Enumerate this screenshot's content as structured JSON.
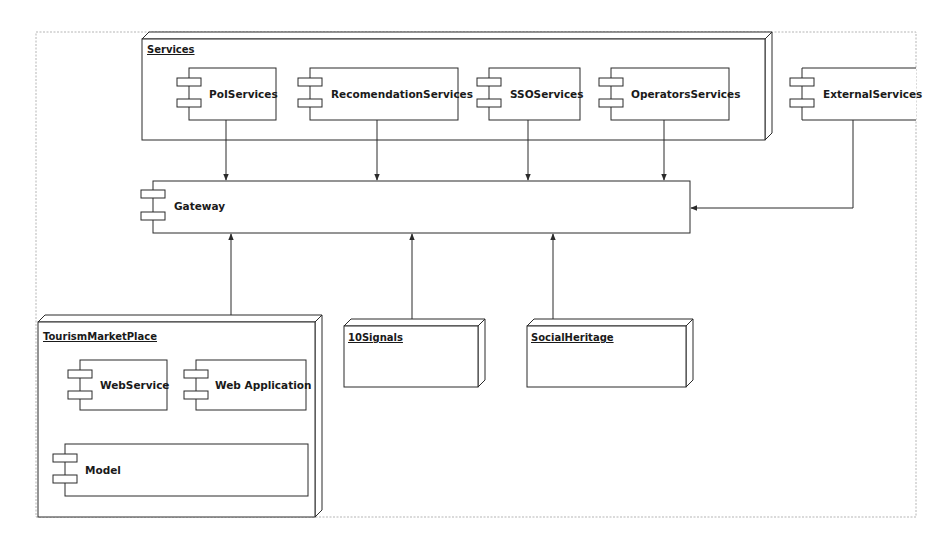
{
  "diagram": {
    "type": "UML deployment/component diagram",
    "colors": {
      "stroke": "#2b2b2b",
      "frame": "#b0b0b0",
      "background": "#ffffff"
    },
    "nodes": {
      "services": {
        "title": "Services"
      },
      "tourism_market_place": {
        "title": "TourismMarketPlace"
      },
      "ten_signals": {
        "title": "10Signals"
      },
      "social_heritage": {
        "title": "SocialHeritage"
      }
    },
    "components": {
      "poi_services": {
        "label": "PoIServices"
      },
      "recomendation_services": {
        "label": "RecomendationServices"
      },
      "sso_services": {
        "label": "SSOServices"
      },
      "operators_services": {
        "label": "OperatorsServices"
      },
      "external_services": {
        "label": "ExternalServices"
      },
      "gateway": {
        "label": "Gateway"
      },
      "web_service": {
        "label": "WebService"
      },
      "web_application": {
        "label": "Web Application"
      },
      "model": {
        "label": "Model"
      }
    },
    "connections": [
      {
        "from": "PoIServices",
        "to": "Gateway"
      },
      {
        "from": "RecomendationServices",
        "to": "Gateway"
      },
      {
        "from": "SSOServices",
        "to": "Gateway"
      },
      {
        "from": "OperatorsServices",
        "to": "Gateway"
      },
      {
        "from": "ExternalServices",
        "to": "Gateway"
      },
      {
        "from": "TourismMarketPlace",
        "to": "Gateway"
      },
      {
        "from": "10Signals",
        "to": "Gateway"
      },
      {
        "from": "SocialHeritage",
        "to": "Gateway"
      },
      {
        "from": "WebService",
        "to": "Model"
      },
      {
        "from": "Web Application",
        "to": "Model"
      }
    ]
  }
}
